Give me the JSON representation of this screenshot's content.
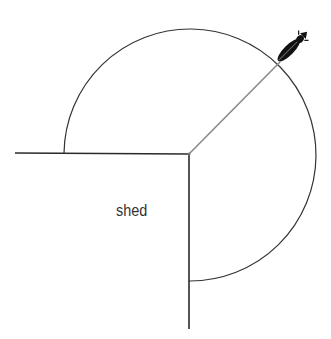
{
  "diagram": {
    "title": "",
    "shed_label": "shed",
    "colors": {
      "wall": "#2a2a2a",
      "arc": "#333333",
      "rope": "#888888",
      "animal": "#111111",
      "background": "#ffffff"
    },
    "geometry": {
      "corner": [
        189,
        154
      ],
      "radius": 126,
      "wall_horizontal_start": [
        15,
        153
      ],
      "wall_vertical_end": [
        189,
        329
      ]
    },
    "animal_icon": "tethered-animal-icon"
  }
}
